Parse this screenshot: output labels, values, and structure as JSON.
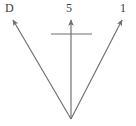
{
  "diagram": {
    "type": "vector-arrow-diagram",
    "background_color": "#ffffff",
    "stroke_color": "#6e6e6e",
    "text_color": "#3c3c3c",
    "origin": {
      "x": 71,
      "y": 119
    },
    "labels": {
      "left": "D",
      "middle": "5",
      "right": "1"
    },
    "arrows": [
      {
        "name": "left-arrow",
        "label": "D",
        "from": {
          "x": 71,
          "y": 119
        },
        "to": {
          "x": 11,
          "y": 17
        }
      },
      {
        "name": "middle-arrow",
        "label": "5",
        "from": {
          "x": 71,
          "y": 119
        },
        "to": {
          "x": 71,
          "y": 17
        }
      },
      {
        "name": "right-arrow",
        "label": "1",
        "from": {
          "x": 71,
          "y": 119
        },
        "to": {
          "x": 124,
          "y": 17
        }
      }
    ],
    "crossbar": {
      "name": "horizontal-crossbar",
      "from": {
        "x": 51,
        "y": 34
      },
      "to": {
        "x": 92,
        "y": 34
      }
    }
  }
}
